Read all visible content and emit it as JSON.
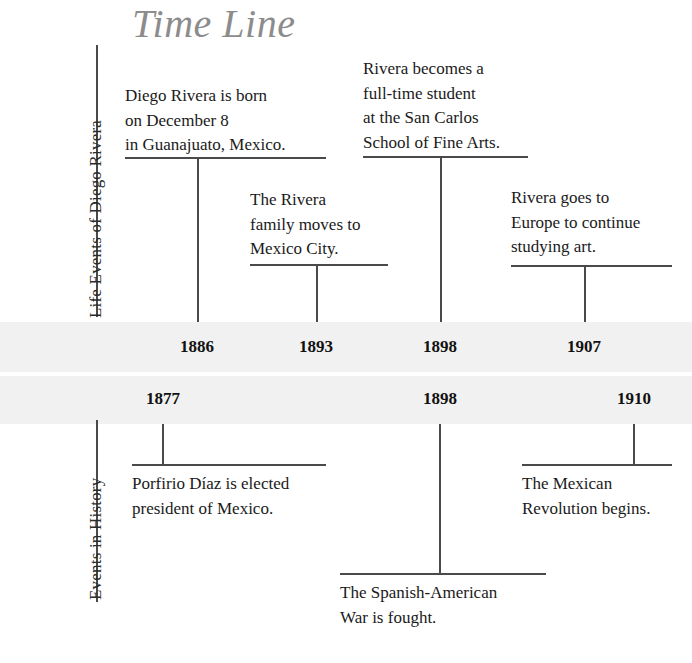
{
  "title": "Time Line",
  "sections": {
    "life": {
      "label": "Life Events of Diego Rivera"
    },
    "history": {
      "label": "Events in History"
    }
  },
  "bands": {
    "life_years": [
      "1886",
      "1893",
      "1898",
      "1907"
    ],
    "history_years": [
      "1877",
      "1898",
      "1910"
    ]
  },
  "life_events": [
    {
      "year": "1886",
      "text": "Diego Rivera is born\non December 8\nin Guanajuato, Mexico."
    },
    {
      "year": "1893",
      "text": "The Rivera\nfamily moves to\nMexico City."
    },
    {
      "year": "1898",
      "text": "Rivera becomes a\nfull-time student\nat the San Carlos\nSchool of Fine Arts."
    },
    {
      "year": "1907",
      "text": "Rivera goes to\nEurope to continue\nstudying art."
    }
  ],
  "history_events": [
    {
      "year": "1877",
      "text": "Porfirio Díaz is elected\npresident of Mexico."
    },
    {
      "year": "1898",
      "text": "The Spanish-American\nWar is fought."
    },
    {
      "year": "1910",
      "text": "The Mexican\nRevolution begins."
    }
  ],
  "colors": {
    "band": "#f1f1f1",
    "rule": "#4a4a4a",
    "title": "#8c8c8c",
    "text": "#1a1a1a"
  }
}
